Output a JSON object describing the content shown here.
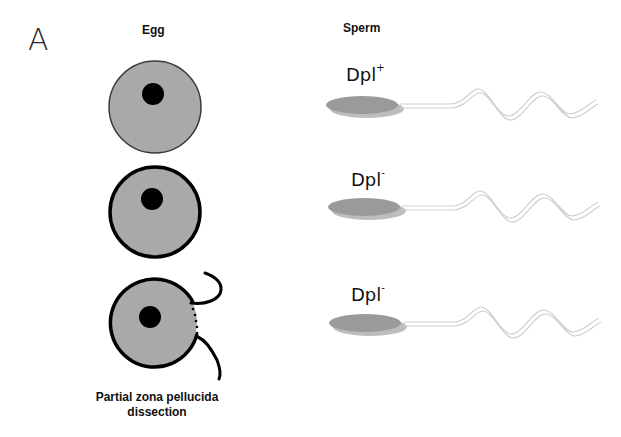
{
  "figure": {
    "panel_label": "A",
    "columns": {
      "egg_header": "Egg",
      "sperm_header": "Sperm"
    },
    "rows": [
      {
        "egg": {
          "state": "intact zona pellucida",
          "border": "thin"
        },
        "sperm": {
          "genotype": "Dpl",
          "superscript": "+"
        }
      },
      {
        "egg": {
          "state": "intact zona pellucida",
          "border": "thick"
        },
        "sperm": {
          "genotype": "Dpl",
          "superscript": "-"
        }
      },
      {
        "egg": {
          "state": "partial zona pellucida dissection",
          "border": "thick-opened"
        },
        "sperm": {
          "genotype": "Dpl",
          "superscript": "-"
        }
      }
    ],
    "caption_line1": "Partial zona pellucida",
    "caption_line2": "dissection",
    "colors": {
      "egg_fill": "#a9a9a9",
      "nucleus": "#000000",
      "sperm_head": "#9a9a9a",
      "sperm_tail": "#c8c8c8"
    }
  }
}
